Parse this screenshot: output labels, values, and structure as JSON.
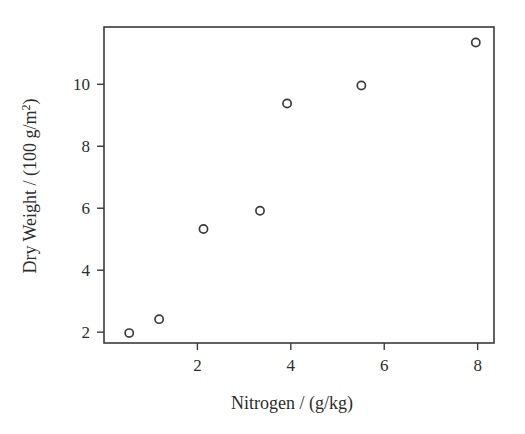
{
  "chart_data": {
    "type": "scatter",
    "title": "",
    "subtitle": "",
    "xlabel": "Nitrogen / (g/kg)",
    "ylabel": "Dry Weight / (100 g/m²)",
    "ylabel_parts": {
      "main": "Dry Weight / (100 g/m",
      "superscript": "2",
      "tail": ")"
    },
    "xlim": [
      0.0,
      8.35
    ],
    "ylim": [
      1.65,
      11.85
    ],
    "xticks": [
      2,
      4,
      6,
      8
    ],
    "xtick_labels": [
      "2",
      "4",
      "6",
      "8"
    ],
    "yticks": [
      2,
      4,
      6,
      8,
      10
    ],
    "ytick_labels": [
      "2",
      "4",
      "6",
      "8",
      "10"
    ],
    "grid": false,
    "legend": null,
    "legend_position": "none",
    "marker": "open-circle",
    "marker_color": "#3c3c3c",
    "background_color": "#ffffff",
    "frame_color": "#3a3a3a",
    "series": [
      {
        "name": "Dry Weight vs Nitrogen",
        "points": [
          {
            "x": 0.54,
            "y": 1.97
          },
          {
            "x": 1.18,
            "y": 2.42
          },
          {
            "x": 2.13,
            "y": 5.33
          },
          {
            "x": 3.34,
            "y": 5.92
          },
          {
            "x": 3.92,
            "y": 9.38
          },
          {
            "x": 5.51,
            "y": 9.96
          },
          {
            "x": 7.96,
            "y": 11.35
          }
        ]
      }
    ]
  }
}
